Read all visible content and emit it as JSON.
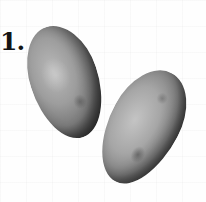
{
  "figure": {
    "label": "1.",
    "items": [
      {
        "name": "left-potato",
        "color": "#9d9d9d"
      },
      {
        "name": "right-potato",
        "color": "#a6a6a6"
      }
    ],
    "background_color": "#fefefe",
    "label_color": "#141414"
  }
}
